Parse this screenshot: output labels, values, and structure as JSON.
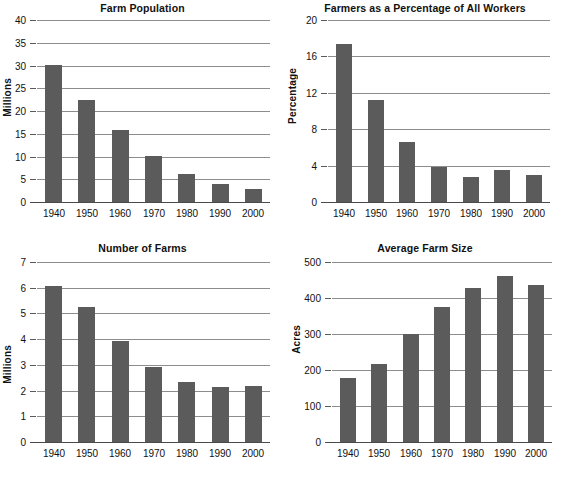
{
  "figure": {
    "background": "#ffffff",
    "bar_color": "#5b5b5b",
    "grid_color": "#8d8d8d",
    "axis_color": "#4a4a4a",
    "text_color": "#111111"
  },
  "chart_data": [
    {
      "type": "bar",
      "id": "farm-population",
      "title": "Farm Population",
      "xlabel": "",
      "ylabel": "Millions",
      "categories": [
        "1940",
        "1950",
        "1960",
        "1970",
        "1980",
        "1990",
        "2000"
      ],
      "values": [
        30.0,
        22.4,
        15.9,
        10.0,
        6.2,
        3.9,
        2.9
      ],
      "ylim": [
        0,
        40
      ],
      "yticks": [
        0,
        5,
        10,
        15,
        20,
        25,
        30,
        35,
        40
      ],
      "ytick_labels": [
        "0",
        "5",
        "10",
        "15",
        "20",
        "25",
        "30",
        "35",
        "40"
      ],
      "grid": true,
      "legend": "none"
    },
    {
      "type": "bar",
      "id": "farmers-percentage",
      "title": "Farmers as a Percentage of All Workers",
      "xlabel": "",
      "ylabel": "Percentage",
      "categories": [
        "1940",
        "1950",
        "1960",
        "1970",
        "1980",
        "1990",
        "2000"
      ],
      "values": [
        17.4,
        11.2,
        6.6,
        3.8,
        2.7,
        3.5,
        3.0
      ],
      "ylim": [
        0,
        20
      ],
      "yticks": [
        0,
        4,
        8,
        12,
        16,
        20
      ],
      "ytick_labels": [
        "0",
        "4",
        "8",
        "12",
        "16",
        "20"
      ],
      "grid": true,
      "legend": "none"
    },
    {
      "type": "bar",
      "id": "number-of-farms",
      "title": "Number of Farms",
      "xlabel": "",
      "ylabel": "Millions",
      "categories": [
        "1940",
        "1950",
        "1960",
        "1970",
        "1980",
        "1990",
        "2000"
      ],
      "values": [
        6.05,
        5.25,
        3.93,
        2.91,
        2.35,
        2.15,
        2.17
      ],
      "ylim": [
        0,
        7
      ],
      "yticks": [
        0,
        1,
        2,
        3,
        4,
        5,
        6,
        7
      ],
      "ytick_labels": [
        "0",
        "1",
        "2",
        "3",
        "4",
        "5",
        "6",
        "7"
      ],
      "grid": true,
      "legend": "none"
    },
    {
      "type": "bar",
      "id": "average-farm-size",
      "title": "Average Farm Size",
      "xlabel": "",
      "ylabel": "Acres",
      "categories": [
        "1940",
        "1950",
        "1960",
        "1970",
        "1980",
        "1990",
        "2000"
      ],
      "values": [
        177,
        218,
        300,
        375,
        428,
        460,
        437
      ],
      "ylim": [
        0,
        500
      ],
      "yticks": [
        0,
        100,
        200,
        300,
        400,
        500
      ],
      "ytick_labels": [
        "0",
        "100",
        "200",
        "300",
        "400",
        "500"
      ],
      "grid": true,
      "legend": "none"
    }
  ]
}
